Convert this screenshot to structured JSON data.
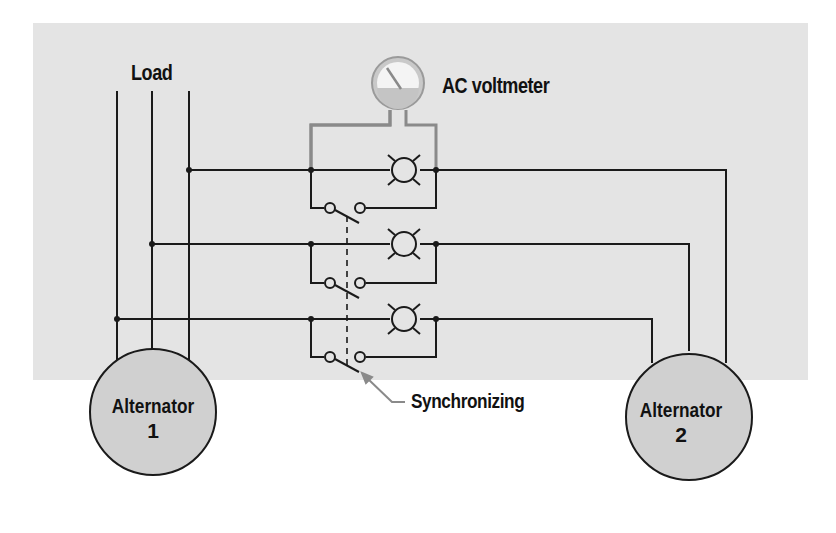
{
  "figure": {
    "labels": {
      "load": "Load",
      "voltmeter": "AC voltmeter",
      "synchronizing": "Synchronizing"
    },
    "alternators": [
      {
        "name": "Alternator",
        "number": "1"
      },
      {
        "name": "Alternator",
        "number": "2"
      }
    ],
    "components": {
      "phases": 3,
      "lamps": 3,
      "switches": 3,
      "meter": "AC voltmeter"
    },
    "colors": {
      "background": "#e4e4e4",
      "line": "#1a1a1a",
      "meter_wire": "#8a8a8a",
      "alternator_fill": "#cfcfcf"
    }
  }
}
